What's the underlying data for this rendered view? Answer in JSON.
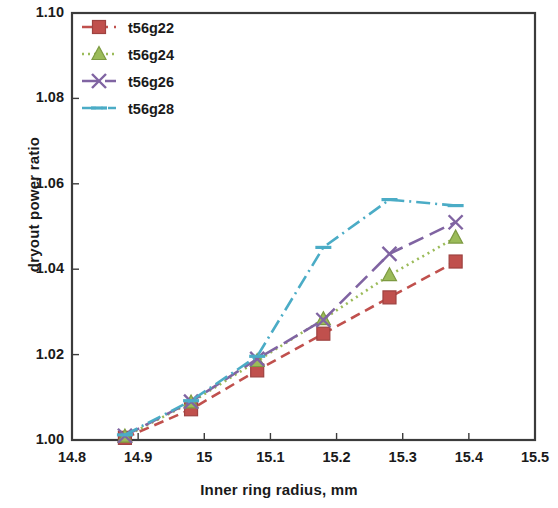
{
  "chart_data": {
    "type": "line",
    "title": "",
    "xlabel": "Inner ring radius, mm",
    "ylabel": "dryout power ratio",
    "xlim": [
      14.8,
      15.5
    ],
    "ylim": [
      1.0,
      1.1
    ],
    "xticks": [
      "14.8",
      "14.9",
      "15",
      "15.1",
      "15.2",
      "15.3",
      "15.4",
      "15.5"
    ],
    "xtick_values": [
      14.8,
      14.9,
      15.0,
      15.1,
      15.2,
      15.3,
      15.4,
      15.5
    ],
    "yticks": [
      "1.00",
      "1.02",
      "1.04",
      "1.06",
      "1.08",
      "1.10"
    ],
    "ytick_values": [
      1.0,
      1.02,
      1.04,
      1.06,
      1.08,
      1.1
    ],
    "grid": false,
    "legend_position": "top-left",
    "x": [
      14.88,
      14.98,
      15.08,
      15.18,
      15.28,
      15.38
    ],
    "series": [
      {
        "name": "t56g22",
        "color": "#c0504d",
        "marker": "square",
        "linestyle": "dashed",
        "values": [
          1.0005,
          1.0072,
          1.0163,
          1.0249,
          1.0334,
          1.0418
        ]
      },
      {
        "name": "t56g24",
        "color": "#9bbb59",
        "marker": "triangle",
        "linestyle": "dotted",
        "values": [
          1.0008,
          1.0088,
          1.0185,
          1.0283,
          1.0386,
          1.0474
        ]
      },
      {
        "name": "t56g26",
        "color": "#8064a2",
        "marker": "x",
        "linestyle": "long-dash",
        "values": [
          1.001,
          1.009,
          1.019,
          1.0281,
          1.0436,
          1.051
        ]
      },
      {
        "name": "t56g28",
        "color": "#4bacc6",
        "marker": "dash",
        "linestyle": "dash-dot",
        "values": [
          1.0012,
          1.0092,
          1.0196,
          1.0451,
          1.0563,
          1.0549
        ]
      }
    ],
    "legend": [
      {
        "label": "t56g22",
        "color": "#c0504d",
        "marker": "square"
      },
      {
        "label": "t56g24",
        "color": "#9bbb59",
        "marker": "triangle"
      },
      {
        "label": "t56g26",
        "color": "#8064a2",
        "marker": "x"
      },
      {
        "label": "t56g28",
        "color": "#4bacc6",
        "marker": "dash"
      }
    ]
  },
  "axes": {
    "frame_color": "#3b3b3b"
  }
}
